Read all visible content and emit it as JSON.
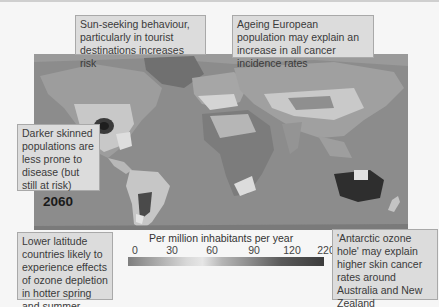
{
  "year_label": "2060",
  "callouts": {
    "sun_seeking": "Sun-seeking behaviour, particularly in tourist destinations increases risk",
    "ageing_europe": "Ageing European population may explain an increase in all cancer incidence rates",
    "darker_skin": "Darker skinned populations are less prone to disease (but still at risk)",
    "lower_latitude": "Lower latitude countries likely to experience effects of ozone depletion in hotter spring and summer months",
    "antarctic_ozone": "'Antarctic ozone hole' may explain higher skin cancer rates around Australia and New Zealand"
  },
  "legend": {
    "title": "Per million inhabitants per year",
    "ticks": [
      "0",
      "30",
      "60",
      "90",
      "120",
      "220"
    ]
  },
  "colors": {
    "ocean": "#8a8a8a",
    "callout_bg": "#dcdcdc",
    "high_incidence": "#2e2e2e",
    "low_incidence": "#e6e6e6"
  }
}
